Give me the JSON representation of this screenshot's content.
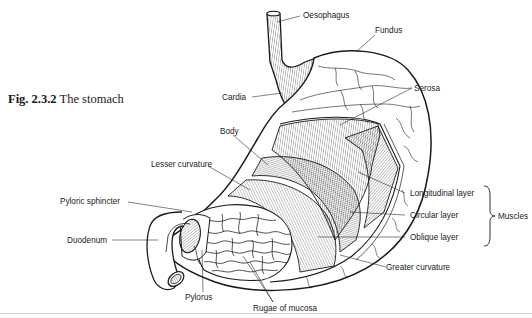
{
  "caption": {
    "figure_number": "Fig. 2.3.2",
    "title": "The stomach"
  },
  "labels": {
    "oesophagus": "Oesophagus",
    "fundus": "Fundus",
    "cardia": "Cardia",
    "serosa": "Serosa",
    "body": "Body",
    "lesser_curvature": "Lesser curvature",
    "pyloric_sphincter": "Pyloric sphincter",
    "duodenum": "Duodenum",
    "pylorus": "Pylorus",
    "rugae_of_mucosa": "Rugae of mucosa",
    "longitudinal_layer": "Longitudinal layer",
    "circular_layer": "Circular layer",
    "oblique_layer": "Oblique layer",
    "greater_curvature": "Greater curvature",
    "muscles": "Muscles"
  },
  "colors": {
    "ink": "#1a1a1a",
    "background": "#ffffff"
  }
}
